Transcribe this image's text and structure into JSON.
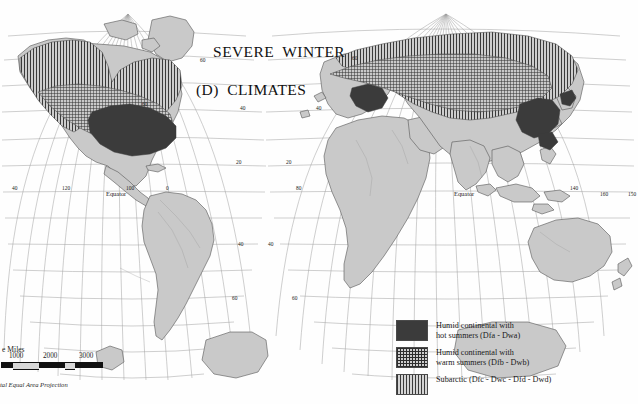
{
  "map": {
    "title_line1": "SEVERE  WINTER",
    "title_line2": "(D)  CLIMATES",
    "projection_note": "tal Equal Area Projection",
    "equator_label_left": "Equator",
    "equator_label_right": "Equator",
    "land_color": "#c9c9c9",
    "graticule_color": "#8f8f8f",
    "coastline_color": "#4d4d4d",
    "background_color": "#fefefe",
    "longitude_labels_left": [
      "40",
      "120",
      "100",
      "0"
    ],
    "longitude_labels_right": [
      "80",
      "140",
      "160",
      "150"
    ],
    "latitude_labels": [
      "60",
      "40",
      "20",
      "40",
      "60"
    ]
  },
  "legend": {
    "items": [
      {
        "swatch": "solid-dark",
        "label": "Humid continental with\nhot summers  (Dfa - Dwa)",
        "color": "#3b3b3b"
      },
      {
        "swatch": "cross-hatch",
        "label": "Humid continental with\nwarm summers  (Dfb - Dwb)",
        "color": "#2e2e2e"
      },
      {
        "swatch": "vertical-lines",
        "label": "Subarctic  (Dfc - Dwc - Dfd - Dwd)",
        "color": "#3a3a3a"
      }
    ]
  },
  "scale": {
    "caption": "e Miles",
    "ticks": [
      "1000",
      "2000",
      "3000"
    ]
  }
}
